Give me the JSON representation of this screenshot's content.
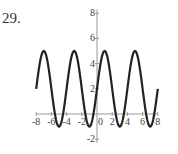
{
  "problem_number": "29.",
  "chart_data": {
    "type": "line",
    "title": "",
    "xlabel": "",
    "ylabel": "",
    "function": "y = 2 + 3 sin(pi x / 2)",
    "xlim": [
      -8,
      8
    ],
    "ylim": [
      -2,
      8
    ],
    "x_ticks": [
      -8,
      -6,
      -4,
      -2,
      0,
      2,
      4,
      6,
      8
    ],
    "y_ticks": [
      -2,
      2,
      4,
      6,
      8
    ],
    "grid": false,
    "series": [
      {
        "name": "curve",
        "x": [
          -8,
          -7,
          -6,
          -5,
          -4,
          -3,
          -2,
          -1,
          0,
          1,
          2,
          3,
          4,
          5,
          6,
          7,
          8
        ],
        "values": [
          2,
          5,
          2,
          -1,
          2,
          5,
          2,
          -1,
          2,
          5,
          2,
          -1,
          2,
          5,
          2,
          -1,
          2
        ]
      }
    ],
    "color": "#222222"
  }
}
